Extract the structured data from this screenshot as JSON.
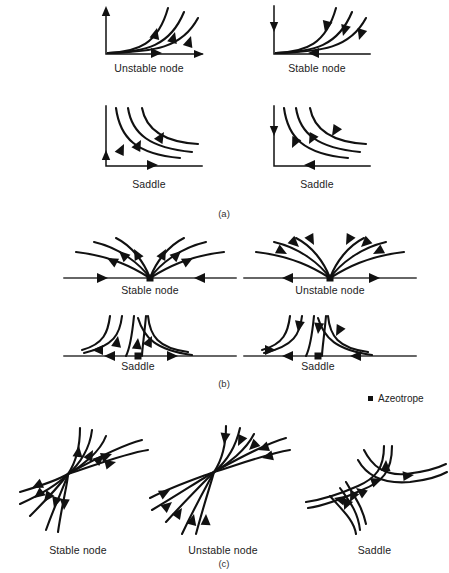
{
  "figure": {
    "sections": [
      {
        "id": "a",
        "label": "(a)",
        "description": "Pure component vertices with L-shaped composition axes",
        "panels": [
          {
            "name": "unstable-node-corner",
            "caption": "Unstable node",
            "flow": "outward",
            "shape": "corner"
          },
          {
            "name": "stable-node-corner",
            "caption": "Stable node",
            "flow": "inward",
            "shape": "corner"
          },
          {
            "name": "saddle-corner-1",
            "caption": "Saddle",
            "flow": "down-right",
            "shape": "corner-hyperbolic"
          },
          {
            "name": "saddle-corner-2",
            "caption": "Saddle",
            "flow": "up-left",
            "shape": "corner-hyperbolic"
          }
        ]
      },
      {
        "id": "b",
        "label": "(b)",
        "description": "Binary azeotropes located on an edge of the composition triangle",
        "panels": [
          {
            "name": "stable-node-edge",
            "caption": "Stable node",
            "flow": "inward",
            "shape": "edge-parabolic"
          },
          {
            "name": "unstable-node-edge",
            "caption": "Unstable node",
            "flow": "outward",
            "shape": "edge-parabolic"
          },
          {
            "name": "saddle-edge-1",
            "caption": "Saddle",
            "flow": "in-from-top-out-along-edge",
            "shape": "edge-saddle"
          },
          {
            "name": "saddle-edge-2",
            "caption": "Saddle",
            "flow": "in-along-edge-out-to-top",
            "shape": "edge-saddle"
          }
        ]
      },
      {
        "id": "c",
        "label": "(c)",
        "description": "Ternary singular points located inside the composition triangle",
        "panels": [
          {
            "name": "stable-node-interior",
            "caption": "Stable node",
            "flow": "inward",
            "shape": "bowtie"
          },
          {
            "name": "unstable-node-interior",
            "caption": "Unstable node",
            "flow": "outward",
            "shape": "bowtie"
          },
          {
            "name": "saddle-interior",
            "caption": "Saddle",
            "flow": "hyperbolic",
            "shape": "crossing"
          }
        ]
      }
    ],
    "legend": {
      "marker": "azeotrope-square-marker",
      "label": "Azeotrope"
    },
    "colors": {
      "curve": "#111111",
      "axis": "#111111",
      "edge": "#333333",
      "text": "#222222",
      "background": "#ffffff"
    }
  }
}
